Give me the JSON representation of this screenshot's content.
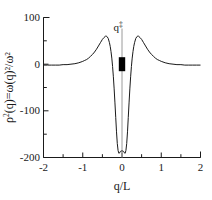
{
  "chart_data": {
    "type": "line",
    "title": "",
    "xlabel": "q/L",
    "ylabel": "ρ ²(q)=ω(q)²/ω²",
    "ylabel_base": "ρ",
    "ylabel_sup": "2",
    "ylabel_rest": "(q)=ω(q)²/ω²",
    "xlim": [
      -2,
      2
    ],
    "ylim": [
      -200,
      100
    ],
    "xticks": [
      -2,
      -1,
      0,
      1,
      2
    ],
    "xtick_labels": [
      "-2",
      "-1",
      "0",
      "1",
      "2"
    ],
    "yticks": [
      100,
      0,
      -100,
      -200
    ],
    "ytick_labels": [
      "100",
      "0",
      "-100",
      "-200"
    ],
    "x_minor_ticks": [
      -1.5,
      -0.5,
      0.5,
      1.5
    ],
    "y_minor_ticks": [
      50,
      -50,
      -150
    ],
    "grid": false,
    "legend": "none",
    "series": [
      {
        "name": "rho2",
        "x": [
          -2.0,
          -1.9,
          -1.8,
          -1.7,
          -1.6,
          -1.5,
          -1.4,
          -1.3,
          -1.2,
          -1.1,
          -1.0,
          -0.95,
          -0.9,
          -0.85,
          -0.8,
          -0.75,
          -0.7,
          -0.65,
          -0.6,
          -0.55,
          -0.5,
          -0.46,
          -0.42,
          -0.4,
          -0.38,
          -0.35,
          -0.32,
          -0.3,
          -0.28,
          -0.26,
          -0.24,
          -0.22,
          -0.2,
          -0.18,
          -0.16,
          -0.14,
          -0.12,
          -0.1,
          -0.08,
          -0.06,
          -0.04,
          -0.02,
          0.0,
          0.02,
          0.04,
          0.06,
          0.08,
          0.1,
          0.12,
          0.14,
          0.16,
          0.18,
          0.2,
          0.22,
          0.24,
          0.26,
          0.28,
          0.3,
          0.32,
          0.35,
          0.38,
          0.4,
          0.42,
          0.46,
          0.5,
          0.55,
          0.6,
          0.65,
          0.7,
          0.75,
          0.8,
          0.85,
          0.9,
          0.95,
          1.0,
          1.1,
          1.2,
          1.3,
          1.4,
          1.5,
          1.6,
          1.7,
          1.8,
          1.9,
          2.0
        ],
        "y": [
          -2,
          -2,
          -2,
          -2,
          -2,
          -1,
          -1,
          0,
          1,
          3,
          6,
          8,
          10,
          13,
          17,
          21,
          26,
          32,
          39,
          46,
          53,
          57,
          60,
          60,
          59,
          55,
          46,
          38,
          27,
          13,
          -5,
          -27,
          -53,
          -83,
          -114,
          -145,
          -170,
          -185,
          -191,
          -190,
          -187,
          -186,
          -186,
          -186,
          -187,
          -190,
          -191,
          -185,
          -170,
          -145,
          -114,
          -83,
          -53,
          -27,
          -5,
          13,
          27,
          38,
          46,
          55,
          59,
          60,
          60,
          57,
          53,
          46,
          39,
          32,
          26,
          21,
          17,
          13,
          10,
          8,
          6,
          3,
          1,
          0,
          -1,
          -1,
          -2,
          -2,
          -2,
          -2,
          -2
        ]
      }
    ],
    "annotations": [
      {
        "name": "q-dagger",
        "label": "q",
        "superscript": "‡",
        "x": 0,
        "y_text": 85,
        "marker": {
          "type": "square-filled",
          "x": 0,
          "y": 0,
          "color": "#000000"
        },
        "guide_line": {
          "from_y": 72,
          "to_y": -200,
          "color": "#9a9a9a"
        }
      }
    ]
  },
  "colors": {
    "curve": "#1a1a1a",
    "axis": "#1a1a1a",
    "marker": "#000000",
    "guide": "#9a9a9a",
    "background": "#ffffff"
  }
}
